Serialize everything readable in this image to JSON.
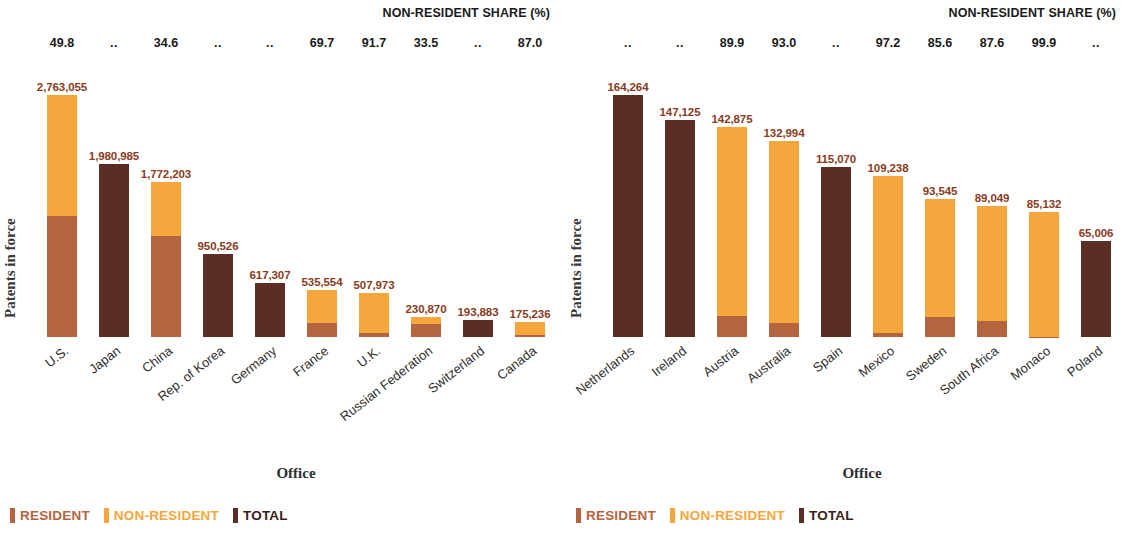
{
  "colors": {
    "resident": "#B4653F",
    "non_resident": "#F5A63C",
    "total": "#5A2E24",
    "value_label": "#8A3B22"
  },
  "legend": {
    "resident": "RESIDENT",
    "non_resident": "NON-RESIDENT",
    "total": "TOTAL"
  },
  "axis": {
    "y_title": "Patents in force",
    "x_title": "Office"
  },
  "share_header": "NON-RESIDENT SHARE (%)",
  "chart_data": [
    {
      "type": "bar",
      "title": "",
      "subtitle": "",
      "panel": "left",
      "xlabel": "Office",
      "ylabel": "Patents in force",
      "stacked": true,
      "grid": false,
      "legend_position": "bottom-left",
      "ylim": [
        0,
        2763055
      ],
      "categories": [
        "U.S.",
        "Japan",
        "China",
        "Rep. of Korea",
        "Germany",
        "France",
        "U.K.",
        "Russian Federation",
        "Switzerland",
        "Canada"
      ],
      "totals": [
        2763055,
        1980985,
        1772203,
        950526,
        617307,
        535554,
        507973,
        230870,
        193883,
        175236
      ],
      "total_labels": [
        "2,763,055",
        "1,980,985",
        "1,772,203",
        "950,526",
        "617,307",
        "535,554",
        "507,973",
        "230,870",
        "193,883",
        "175,236"
      ],
      "non_resident_share": [
        49.8,
        null,
        34.6,
        null,
        null,
        69.7,
        91.7,
        33.5,
        null,
        87.0
      ],
      "non_resident_share_labels": [
        "49.8",
        "..",
        "34.6",
        "..",
        "..",
        "69.7",
        "91.7",
        "33.5",
        "..",
        "87.0"
      ],
      "series": [
        {
          "name": "RESIDENT",
          "values": [
            1386053,
            null,
            1158981,
            null,
            null,
            162273,
            42162,
            153528,
            null,
            22781
          ]
        },
        {
          "name": "NON-RESIDENT",
          "values": [
            1377002,
            null,
            613222,
            null,
            null,
            373281,
            465811,
            77342,
            null,
            152455
          ]
        },
        {
          "name": "TOTAL",
          "values": [
            null,
            1980985,
            null,
            950526,
            617307,
            null,
            null,
            null,
            193883,
            null
          ]
        }
      ]
    },
    {
      "type": "bar",
      "title": "",
      "subtitle": "",
      "panel": "right",
      "xlabel": "Office",
      "ylabel": "Patents in force",
      "stacked": true,
      "grid": false,
      "legend_position": "bottom-left",
      "ylim": [
        0,
        164264
      ],
      "categories": [
        "Netherlands",
        "Ireland",
        "Austria",
        "Australia",
        "Spain",
        "Mexico",
        "Sweden",
        "South Africa",
        "Monaco",
        "Poland"
      ],
      "totals": [
        164264,
        147125,
        142875,
        132994,
        115070,
        109238,
        93545,
        89049,
        85132,
        65006
      ],
      "total_labels": [
        "164,264",
        "147,125",
        "142,875",
        "132,994",
        "115,070",
        "109,238",
        "93,545",
        "89,049",
        "85,132",
        "65,006"
      ],
      "non_resident_share": [
        null,
        null,
        89.9,
        93.0,
        null,
        97.2,
        85.6,
        87.6,
        99.9,
        null
      ],
      "non_resident_share_labels": [
        "..",
        "..",
        "89.9",
        "93.0",
        "..",
        "97.2",
        "85.6",
        "87.6",
        "99.9",
        ".."
      ],
      "series": [
        {
          "name": "RESIDENT",
          "values": [
            null,
            null,
            14430,
            9310,
            null,
            3059,
            13470,
            11042,
            85,
            null
          ]
        },
        {
          "name": "NON-RESIDENT",
          "values": [
            null,
            null,
            128445,
            123684,
            null,
            106179,
            80075,
            78007,
            85047,
            null
          ]
        },
        {
          "name": "TOTAL",
          "values": [
            164264,
            147125,
            null,
            null,
            115070,
            null,
            null,
            null,
            null,
            65006
          ]
        }
      ]
    }
  ]
}
